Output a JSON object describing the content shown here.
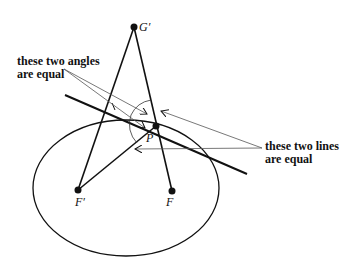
{
  "diagram": {
    "points": {
      "g_prime": "G′",
      "p": "P",
      "f_prime": "F′",
      "f": "F"
    },
    "annotations": {
      "angles_line1": "these two angles",
      "angles_line2": "are equal",
      "lines_line1": "these two lines",
      "lines_line2": "are equal"
    }
  }
}
